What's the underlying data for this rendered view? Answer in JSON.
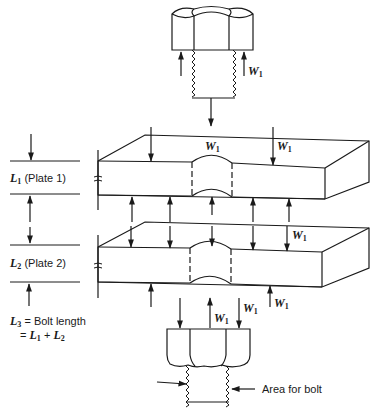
{
  "diagram": {
    "load_symbol": "W",
    "load_subscript": "1",
    "labels": {
      "plate1": {
        "var": "L",
        "sub": "1",
        "text": " (Plate 1)"
      },
      "plate2": {
        "var": "L",
        "sub": "2",
        "text": " (Plate 2)"
      },
      "bolt_length": {
        "var": "L",
        "sub": "3",
        "text": " = Bolt length",
        "eq_prefix": "= ",
        "eq_a_var": "L",
        "eq_a_sub": "1",
        "eq_op": " + ",
        "eq_b_var": "L",
        "eq_b_sub": "2"
      },
      "area_for_bolt": "Area for bolt"
    },
    "components": [
      {
        "name": "bolt-head-top",
        "type": "hex bolt head with threaded shank"
      },
      {
        "name": "plate-1",
        "type": "rectangular plate with bolt hole"
      },
      {
        "name": "plate-2",
        "type": "rectangular plate with bolt hole"
      },
      {
        "name": "nut-bottom",
        "type": "hex nut with threaded shank"
      }
    ],
    "colors": {
      "line": "#1a1a1a",
      "background": "#ffffff"
    }
  }
}
